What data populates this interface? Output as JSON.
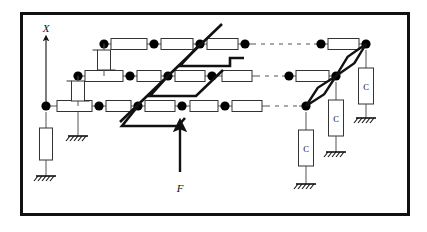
{
  "figure": {
    "kind": "schematic-diagram",
    "title_visible": false,
    "frame": {
      "stroke": "#111111",
      "fill": "#ffffff",
      "border_px": 3
    },
    "colors": {
      "thin_line": "#555555",
      "bold_line": "#111111",
      "node_fill": "#000000",
      "box_stroke": "#333333",
      "box_fill": "#ffffff",
      "ground_stroke": "#111111"
    }
  },
  "labels": {
    "axis_x": "X",
    "force": "F",
    "capacitor": "C"
  },
  "legend_notes": {
    "axis_x_description": "vertical coordinate axis arrow pointing up, labeled X",
    "force_description": "bold upward arrow labeled F applied to the lower bold polyline",
    "capacitor_description": "three vertical boxes labeled C connected to ground hatch symbols"
  },
  "chart_data": {
    "type": "diagram",
    "rows": [
      {
        "id": "row-top",
        "y": 44,
        "nodes": [
          {
            "x": 104,
            "solid": true
          },
          {
            "x": 154,
            "solid": true
          },
          {
            "x": 200,
            "solid": true
          },
          {
            "x": 245,
            "solid": true
          },
          {
            "x": 321,
            "solid": true
          },
          {
            "x": 366,
            "solid": true
          }
        ],
        "resistors": [
          {
            "x1": 111,
            "x2": 147
          },
          {
            "x1": 161,
            "x2": 193
          },
          {
            "x1": 207,
            "x2": 238
          },
          {
            "x1": 328,
            "x2": 359
          }
        ],
        "dashed_gap": {
          "x1": 252,
          "x2": 314
        }
      },
      {
        "id": "row-middle",
        "y": 76,
        "nodes": [
          {
            "x": 78,
            "solid": true
          },
          {
            "x": 130,
            "solid": true
          },
          {
            "x": 168,
            "solid": true
          },
          {
            "x": 212,
            "solid": true
          },
          {
            "x": 289,
            "solid": true
          },
          {
            "x": 336,
            "solid": true
          }
        ],
        "resistors": [
          {
            "x1": 85,
            "x2": 123
          },
          {
            "x1": 137,
            "x2": 161
          },
          {
            "x1": 175,
            "x2": 205
          },
          {
            "x1": 222,
            "x2": 252
          },
          {
            "x1": 296,
            "x2": 329
          }
        ],
        "dashed_gap": {
          "x1": 256,
          "x2": 282
        }
      },
      {
        "id": "row-bottom",
        "y": 106,
        "nodes": [
          {
            "x": 46,
            "solid": true
          },
          {
            "x": 99,
            "solid": true
          },
          {
            "x": 138,
            "solid": true
          },
          {
            "x": 182,
            "solid": true
          },
          {
            "x": 225,
            "solid": true
          },
          {
            "x": 306,
            "solid": true
          }
        ],
        "resistors": [
          {
            "x1": 57,
            "x2": 92
          },
          {
            "x1": 106,
            "x2": 131
          },
          {
            "x1": 145,
            "x2": 175
          },
          {
            "x1": 190,
            "x2": 218
          },
          {
            "x1": 232,
            "x2": 262
          }
        ],
        "dashed_gap": {
          "x1": 266,
          "x2": 299
        }
      }
    ],
    "vertical_couplers": [
      {
        "x": 104,
        "y1": 44,
        "y2": 76,
        "element": "box"
      },
      {
        "x": 78,
        "y1": 76,
        "y2": 106,
        "element": "box"
      }
    ],
    "diagonal_main": {
      "x1": 120,
      "y1": 122,
      "x2": 222,
      "y2": 24,
      "bold": true
    },
    "bold_polylines": [
      {
        "points": "200,44 180,66 230,66 230,58 244,58"
      },
      {
        "points": "168,76 150,96 196,96 223,70"
      },
      {
        "points": "138,106 122,126 178,126 185,118"
      }
    ],
    "rhombus_links": [
      {
        "x1": 306,
        "y1": 106,
        "x2": 336,
        "y2": 76
      },
      {
        "x1": 336,
        "y1": 76,
        "x2": 366,
        "y2": 44
      }
    ],
    "capacitors": [
      {
        "label": "C",
        "x": 306,
        "top_y": 112,
        "box_y": 130,
        "box_h": 36,
        "ground_y": 184
      },
      {
        "label": "C",
        "x": 336,
        "top_y": 82,
        "box_y": 100,
        "box_h": 36,
        "ground_y": 152
      },
      {
        "label": "C",
        "x": 366,
        "top_y": 50,
        "box_y": 68,
        "box_h": 36,
        "ground_y": 118
      }
    ],
    "grounded_boxes_left": [
      {
        "x": 46,
        "top_y": 112,
        "box_y": 128,
        "box_h": 32,
        "ground_y": 176,
        "label": ""
      },
      {
        "x": 78,
        "top_y": 112,
        "box_y": 112,
        "box_h": 0,
        "ground_y": 136,
        "label": ""
      }
    ],
    "axis_arrow": {
      "x": 46,
      "y_base": 106,
      "y_tip": 38,
      "label": "X",
      "label_x": 46,
      "label_y": 32
    },
    "force_arrow": {
      "x": 180,
      "y_base": 172,
      "y_tip": 122,
      "label": "F",
      "label_x": 180,
      "label_y": 190
    }
  }
}
